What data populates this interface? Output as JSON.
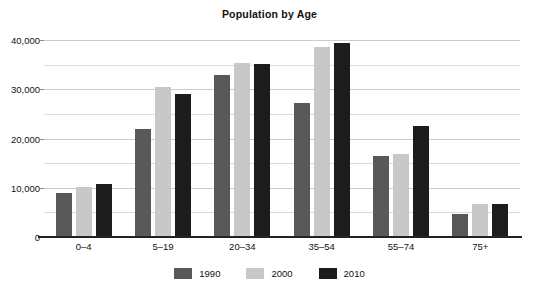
{
  "chart_data": {
    "type": "bar",
    "title": "Population by Age",
    "xlabel": "",
    "ylabel": "",
    "categories": [
      "0–4",
      "5–19",
      "20–34",
      "35–54",
      "55–74",
      "75+"
    ],
    "series": [
      {
        "name": "1990",
        "color": "#595959",
        "values": [
          9000,
          22000,
          32800,
          27200,
          16400,
          4600
        ]
      },
      {
        "name": "2000",
        "color": "#c8c8c8",
        "values": [
          10200,
          30400,
          35400,
          38600,
          16800,
          6800
        ]
      },
      {
        "name": "2010",
        "color": "#1c1c1c",
        "values": [
          10800,
          29000,
          35200,
          39400,
          22600,
          6800
        ]
      }
    ],
    "ylim": [
      0,
      40000
    ],
    "ytick_values": [
      0,
      10000,
      20000,
      30000,
      40000
    ],
    "ytick_labels": [
      "0",
      "10,000",
      "20,000",
      "30,000",
      "40,000"
    ],
    "yminor_values": [
      5000,
      15000,
      25000,
      35000
    ],
    "grid": true,
    "legend_position": "bottom"
  },
  "legend": {
    "entries": [
      {
        "label": "1990"
      },
      {
        "label": "2000"
      },
      {
        "label": "2010"
      }
    ]
  }
}
